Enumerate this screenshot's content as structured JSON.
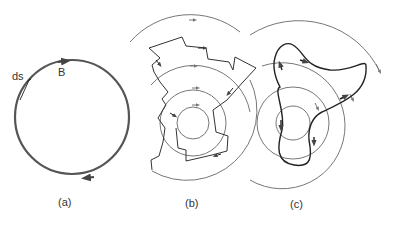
{
  "figure": {
    "panels": [
      {
        "id": "a",
        "caption": "(a)",
        "labels": {
          "ds": "ds",
          "B": "B"
        }
      },
      {
        "id": "b",
        "caption": "(b)"
      },
      {
        "id": "c",
        "caption": "(c)"
      }
    ],
    "colors": {
      "thick_loop": "#555555",
      "field_lines": "#777777",
      "path": "#222222",
      "text": "#333333"
    }
  }
}
